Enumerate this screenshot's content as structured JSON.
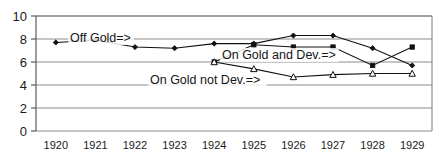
{
  "chart_data": {
    "type": "line",
    "title": "",
    "xlabel": "",
    "ylabel": "",
    "categories": [
      "1920",
      "1921",
      "1922",
      "1923",
      "1924",
      "1925",
      "1926",
      "1927",
      "1928",
      "1929"
    ],
    "xlim": [
      1919.5,
      1929.5
    ],
    "ylim": [
      0,
      10
    ],
    "yticks": [
      0,
      2,
      4,
      6,
      8,
      10
    ],
    "ytick_labels": [
      "0",
      "2",
      "4",
      "6",
      "8",
      "10"
    ],
    "grid": true,
    "grid_axis": "y",
    "legend": "inline-annotations",
    "series": [
      {
        "name": "Off Gold",
        "marker": "diamond",
        "x": [
          "1920",
          "1921",
          "1922",
          "1923",
          "1924",
          "1925",
          "1926",
          "1927",
          "1928",
          "1929"
        ],
        "values": [
          7.7,
          7.9,
          7.3,
          7.2,
          7.6,
          7.6,
          8.3,
          8.3,
          7.2,
          5.7
        ]
      },
      {
        "name": "On Gold and Dev.",
        "marker": "square",
        "x": [
          "1924",
          "1925",
          "1926",
          "1927",
          "1928",
          "1929"
        ],
        "values": [
          6.0,
          7.5,
          7.3,
          7.3,
          5.7,
          7.3
        ]
      },
      {
        "name": "On Gold not Dev.",
        "marker": "triangle",
        "x": [
          "1924",
          "1925",
          "1926",
          "1927",
          "1928",
          "1929"
        ],
        "values": [
          6.0,
          5.4,
          4.7,
          4.9,
          5.0,
          5.0
        ]
      }
    ],
    "annotations": [
      {
        "text": "Off Gold=>",
        "x_px": 70,
        "y_px": 42
      },
      {
        "text": "On Gold and Dev.=>",
        "x_px": 222,
        "y_px": 59
      },
      {
        "text": "On Gold not Dev.=>",
        "x_px": 150,
        "y_px": 84
      }
    ]
  },
  "axis": {
    "y_labels": [
      "10",
      "8",
      "6",
      "4",
      "2",
      "0"
    ],
    "x_labels": [
      "1920",
      "1921",
      "1922",
      "1923",
      "1924",
      "1925",
      "1926",
      "1927",
      "1928",
      "1929"
    ]
  }
}
